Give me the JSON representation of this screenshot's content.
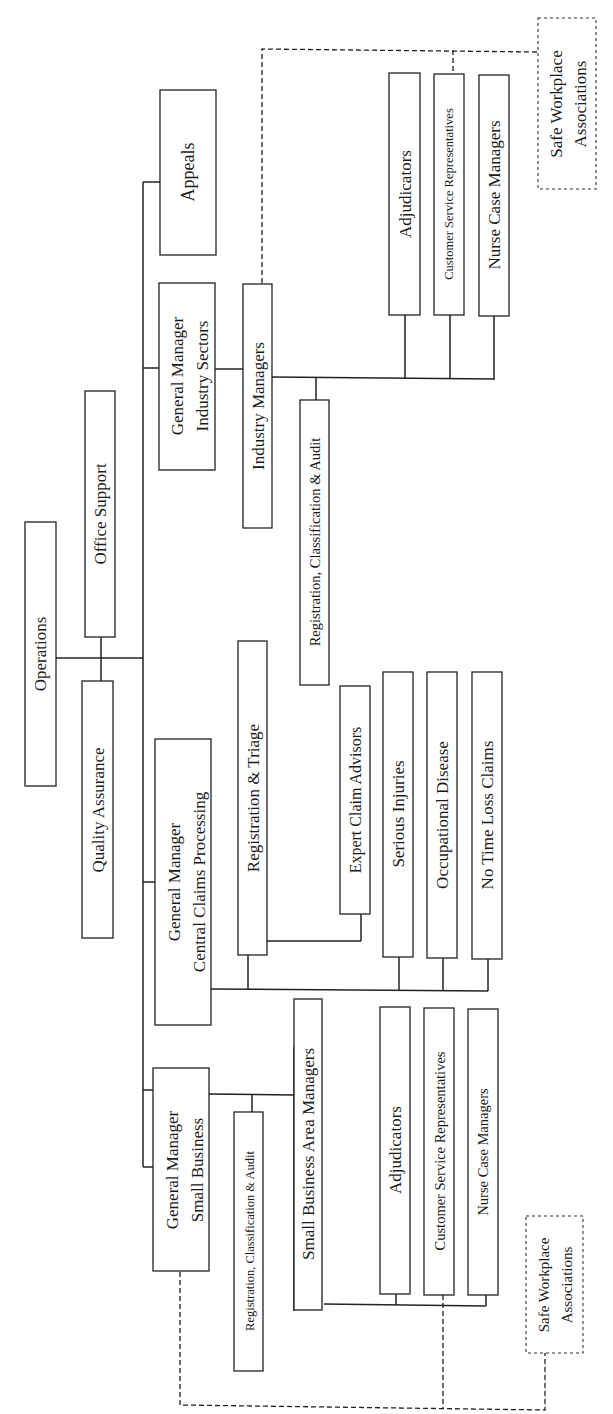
{
  "diagram": {
    "type": "org-chart",
    "orientation": "rotated-90-ccw",
    "root": "Operations",
    "nodes": {
      "operations": "Operations",
      "office_support": "Office Support",
      "quality_assurance": "Quality Assurance",
      "appeals": "Appeals",
      "gm_industry_sectors": [
        "General Manager",
        "Industry Sectors"
      ],
      "industry_managers": "Industry Managers",
      "industry_reg_class_audit": "Registration, Classification & Audit",
      "industry_adjudicators": "Adjudicators",
      "industry_csr": "Customer Service Representatives",
      "industry_nurse_case_managers": "Nurse Case Managers",
      "swa_top": [
        "Safe Workplace",
        "Associations"
      ],
      "gm_central_claims": [
        "General Manager",
        "Central Claims Processing"
      ],
      "registration_triage": "Registration & Triage",
      "expert_claim_advisors": "Expert Claim Advisors",
      "serious_injuries": "Serious Injuries",
      "occupational_disease": "Occupational Disease",
      "no_time_loss_claims": "No Time Loss Claims",
      "gm_small_business": [
        "General Manager",
        "Small Business"
      ],
      "sb_reg_class_audit": "Registration, Classification & Audit",
      "sb_area_managers": "Small Business Area Managers",
      "sb_adjudicators": "Adjudicators",
      "sb_csr": "Customer Service Representatives",
      "sb_nurse_case_managers": "Nurse Case Managers",
      "swa_bottom": [
        "Safe Workplace",
        "Associations"
      ]
    },
    "edges": [
      [
        "Operations",
        "Office Support"
      ],
      [
        "Operations",
        "Quality Assurance"
      ],
      [
        "Operations",
        "Appeals"
      ],
      [
        "Operations",
        "General Manager Industry Sectors"
      ],
      [
        "Operations",
        "General Manager Central Claims Processing"
      ],
      [
        "Operations",
        "General Manager Small Business"
      ],
      [
        "General Manager Industry Sectors",
        "Industry Managers"
      ],
      [
        "Industry Managers",
        "Registration, Classification & Audit"
      ],
      [
        "Industry Managers",
        "Adjudicators"
      ],
      [
        "Industry Managers",
        "Customer Service Representatives"
      ],
      [
        "Industry Managers",
        "Nurse Case Managers"
      ],
      [
        "General Manager Central Claims Processing",
        "Registration & Triage"
      ],
      [
        "Registration & Triage",
        "Expert Claim Advisors"
      ],
      [
        "General Manager Central Claims Processing",
        "Serious Injuries"
      ],
      [
        "General Manager Central Claims Processing",
        "Occupational Disease"
      ],
      [
        "General Manager Central Claims Processing",
        "No Time Loss Claims"
      ],
      [
        "General Manager Small Business",
        "Registration, Classification & Audit"
      ],
      [
        "General Manager Small Business",
        "Small Business Area Managers"
      ],
      [
        "Small Business Area Managers",
        "Adjudicators"
      ],
      [
        "Small Business Area Managers",
        "Customer Service Representatives"
      ],
      [
        "Small Business Area Managers",
        "Nurse Case Managers"
      ]
    ],
    "dashed_links": [
      [
        "Industry Managers",
        "Safe Workplace Associations"
      ],
      [
        "Customer Service Representatives (Industry)",
        "Safe Workplace Associations"
      ],
      [
        "General Manager Small Business",
        "Safe Workplace Associations"
      ],
      [
        "Customer Service Representatives (Small Business)",
        "Safe Workplace Associations"
      ]
    ]
  }
}
